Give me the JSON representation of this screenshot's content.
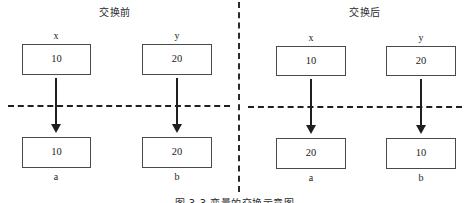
{
  "figure": {
    "caption": "图 3-3  变量的交换示意图",
    "divider_icon": "vertical-dash-dot-divider",
    "panels": [
      {
        "id": "before",
        "title": "交换前",
        "top_row": [
          {
            "label": "x",
            "value": "10"
          },
          {
            "label": "y",
            "value": "20"
          }
        ],
        "bottom_row": [
          {
            "label": "a",
            "value": "10"
          },
          {
            "label": "b",
            "value": "20"
          }
        ],
        "separator_icon": "horizontal-dashed-line",
        "arrow_icon": "down-arrow"
      },
      {
        "id": "after",
        "title": "交换后",
        "top_row": [
          {
            "label": "x",
            "value": "10"
          },
          {
            "label": "y",
            "value": "20"
          }
        ],
        "bottom_row": [
          {
            "label": "a",
            "value": "20"
          },
          {
            "label": "b",
            "value": "10"
          }
        ],
        "separator_icon": "horizontal-dashed-line",
        "arrow_icon": "down-arrow"
      }
    ]
  },
  "colors": {
    "background": "#ffffff",
    "box_border": "#4a4a4a",
    "line": "#1f1f1f",
    "text": "#1a1a1a"
  }
}
